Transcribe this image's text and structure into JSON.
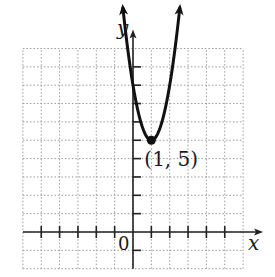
{
  "chart_data": {
    "type": "line",
    "title": "",
    "xlabel": "x",
    "ylabel": "y",
    "origin_label": "0",
    "xlim": [
      -6,
      6
    ],
    "ylim": [
      -2,
      10
    ],
    "grid": true,
    "grid_style": "dotted",
    "tick_step": 1,
    "series": [
      {
        "name": "parabola",
        "equation": "y = 3(x - 1)^2 + 5",
        "opens": "up",
        "arrows_at_ends": true,
        "x": [
          -0.55,
          -0.5,
          0,
          0.5,
          1,
          1.5,
          2,
          2.5,
          2.55
        ],
        "y": [
          12.2,
          11.75,
          8,
          5.75,
          5,
          5.75,
          8,
          11.75,
          12.2
        ]
      }
    ],
    "annotations": [
      {
        "type": "point",
        "x": 1,
        "y": 5,
        "label": "(1, 5)",
        "marker": "filled-circle"
      }
    ],
    "legend": null
  }
}
